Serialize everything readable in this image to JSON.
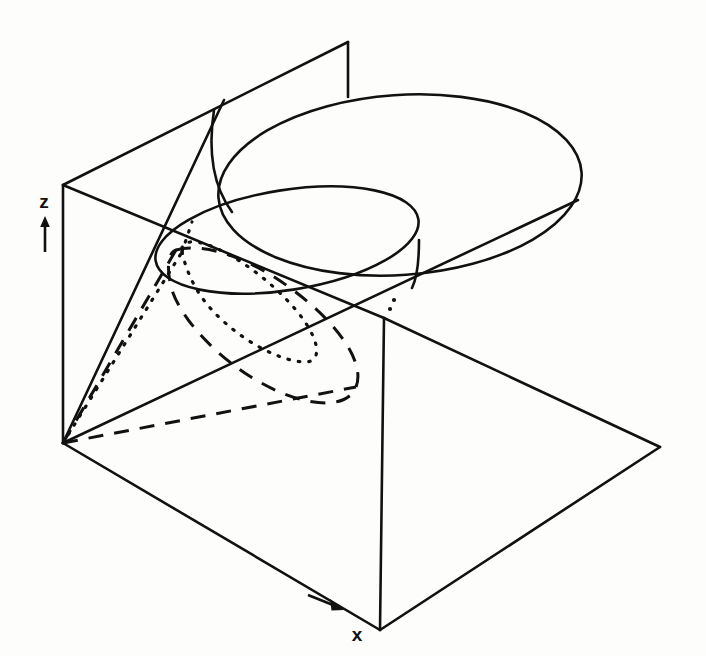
{
  "figure": {
    "kind": "3d-geometry-diagram",
    "title": "",
    "caption": "",
    "background_color": "#fdfdfc",
    "stroke_color": "#111111"
  },
  "axes": {
    "labels": [
      {
        "id": "z-axis",
        "text": "z",
        "x": 44,
        "y": 208,
        "arrow": {
          "direction": "up",
          "x1": 45,
          "y1": 250,
          "x2": 45,
          "y2": 219
        }
      },
      {
        "id": "x-axis",
        "text": "x",
        "x": 357,
        "y": 638,
        "arrow": {
          "direction": "right-down",
          "x1": 309,
          "y1": 596,
          "x2": 340,
          "y2": 609
        }
      }
    ]
  },
  "geometry": {
    "apex": {
      "x": 63,
      "y": 443
    },
    "cone_rim_ellipse": {
      "cx": 400,
      "cy": 185,
      "rx": 182,
      "ry": 90,
      "rotation": -4,
      "style": "solid"
    },
    "conic_section_ellipse": {
      "cx": 287,
      "cy": 240,
      "rx": 133,
      "ry": 50,
      "rotation": -9,
      "style": "solid"
    },
    "vertical_plane": {
      "style": "solid",
      "corners": [
        {
          "x": 63,
          "y": 185
        },
        {
          "x": 348,
          "y": 42
        },
        {
          "x": 348,
          "y": 96
        },
        {
          "x": 63,
          "y": 443
        }
      ]
    },
    "base_plane": {
      "style": "solid",
      "corners": [
        {
          "x": 63,
          "y": 443
        },
        {
          "x": 380,
          "y": 630
        },
        {
          "x": 660,
          "y": 447
        },
        {
          "x": 380,
          "y": 318
        }
      ]
    },
    "projection_curves": [
      {
        "id": "ellipse-projection-on-base",
        "style": "dashed"
      },
      {
        "id": "ellipse-projection-on-vertical-plane",
        "style": "dotted"
      }
    ]
  }
}
